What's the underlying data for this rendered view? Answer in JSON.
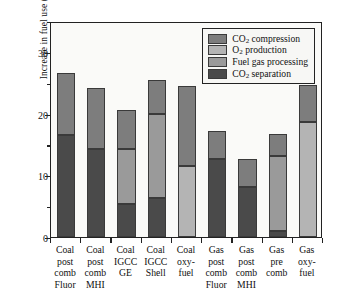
{
  "chart_data": {
    "type": "bar",
    "stacked": true,
    "title": "",
    "xlabel": "",
    "ylabel": "Increase in fuel use (%)",
    "ylim": [
      0,
      35
    ],
    "yticks": [
      0,
      10,
      20,
      30
    ],
    "yticks_minor": [
      5,
      15,
      25,
      35
    ],
    "grid": false,
    "legend_position": "top-right inside plot",
    "categories": [
      "Coal post comb Fluor",
      "Coal post comb MHI",
      "Coal IGCC GE",
      "Coal IGCC Shell",
      "Coal oxy-fuel",
      "Gas post comb Fluor",
      "Gas post comb MHI",
      "Gas pre comb",
      "Gas oxy-fuel"
    ],
    "category_lines": [
      [
        "Coal",
        "post",
        "comb",
        "Fluor"
      ],
      [
        "Coal",
        "post",
        "comb",
        "MHI"
      ],
      [
        "Coal",
        "IGCC",
        "GE"
      ],
      [
        "Coal",
        "IGCC",
        "Shell"
      ],
      [
        "Coal",
        "oxy-",
        "fuel"
      ],
      [
        "Gas",
        "post",
        "comb",
        "Fluor"
      ],
      [
        "Gas",
        "post",
        "comb",
        "MHI"
      ],
      [
        "Gas",
        "pre",
        "comb"
      ],
      [
        "Gas",
        "oxy-",
        "fuel"
      ]
    ],
    "series": [
      {
        "name": "CO2 separation",
        "label_html": "CO<sub>2</sub> separation",
        "color": "#4a4a4a",
        "values": [
          16.5,
          14.2,
          5.3,
          6.3,
          0,
          12.7,
          8.1,
          1.0,
          0
        ]
      },
      {
        "name": "Fuel gas processing",
        "label_html": "Fuel gas processing",
        "color": "#9a9a9a",
        "values": [
          0,
          0,
          9.0,
          13.7,
          0,
          0,
          0,
          12.2,
          0
        ]
      },
      {
        "name": "O2 production",
        "label_html": "O<sub>2</sub> production",
        "color": "#b4b4b4",
        "values": [
          0,
          0,
          0,
          0,
          11.5,
          0,
          0,
          0,
          18.6
        ]
      },
      {
        "name": "CO2 compression",
        "label_html": "CO<sub>2</sub> compression",
        "color": "#7d7d7d",
        "values": [
          10.1,
          9.9,
          6.3,
          5.5,
          13.0,
          4.5,
          4.6,
          3.5,
          6.0
        ]
      }
    ],
    "totals": [
      26.6,
      24.1,
      20.6,
      25.5,
      24.5,
      17.2,
      12.7,
      16.7,
      24.6
    ]
  },
  "legend": {
    "entries": [
      {
        "label_html": "CO<sub>2</sub> compression",
        "color": "#7d7d7d"
      },
      {
        "label_html": "O<sub>2</sub> production",
        "color": "#b4b4b4"
      },
      {
        "label_html": "Fuel gas processing",
        "color": "#9a9a9a"
      },
      {
        "label_html": "CO<sub>2</sub> separation",
        "color": "#4a4a4a"
      }
    ]
  },
  "axis": {
    "y_title": "Increase in fuel use (%)",
    "y_tick_labels": [
      "0",
      "10",
      "20",
      "30"
    ]
  }
}
